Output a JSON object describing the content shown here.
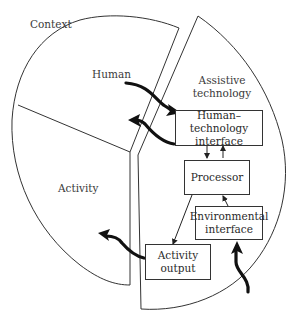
{
  "diagram": {
    "regions": {
      "context": "Context",
      "human": "Human",
      "activity": "Activity",
      "assistive_technology_line1": "Assistive",
      "assistive_technology_line2": "technology"
    },
    "boxes": {
      "hti_line1": "Human–technology",
      "hti_line2": "interface",
      "processor": "Processor",
      "env_line1": "Environmental",
      "env_line2": "interface",
      "activity_output_line1": "Activity",
      "activity_output_line2": "output"
    },
    "colors": {
      "stroke": "#333333",
      "arrow": "#111111",
      "text": "#3a3a3a",
      "background": "#ffffff"
    }
  }
}
